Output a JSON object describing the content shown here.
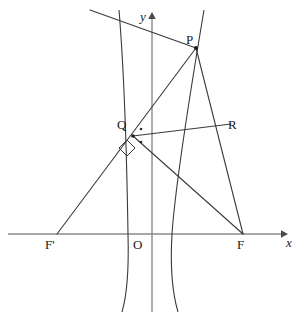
{
  "figure": {
    "width": 299,
    "height": 318,
    "background_color": "#ffffff",
    "curve_color": "#3a3a3a",
    "line_color": "#3a3a3a",
    "axis_color": "#8a8a8a",
    "label_color": "#1a1a1a"
  },
  "axes": {
    "x_axis": {
      "label": "x",
      "label_x": 288,
      "label_y": 241,
      "y": 234,
      "x_start": 8,
      "x_end": 284,
      "arrow": true
    },
    "y_axis": {
      "label": "y",
      "label_x": 140,
      "label_y": 13,
      "x": 152,
      "y_start": 312,
      "y_end": 16,
      "arrow": true
    },
    "origin": {
      "label": "O",
      "label_x": 134,
      "label_y": 240,
      "x": 152,
      "y": 234
    }
  },
  "points": [
    {
      "id": "P",
      "label": "P",
      "x": 196,
      "y": 48,
      "label_x": 186,
      "label_y": 38,
      "dot": true
    },
    {
      "id": "Q",
      "label": "Q",
      "x": 133,
      "y": 136,
      "label_x": 119,
      "label_y": 120,
      "dot": true
    },
    {
      "id": "R",
      "label": "R",
      "x": 222,
      "y": 128,
      "label_x": 228,
      "label_y": 119,
      "dot": false
    },
    {
      "id": "F1",
      "label": "F'",
      "x": 57,
      "y": 234,
      "label_x": 48,
      "label_y": 240,
      "dot": false
    },
    {
      "id": "F2",
      "label": "F",
      "x": 243,
      "y": 234,
      "label_x": 238,
      "label_y": 240,
      "dot": false
    }
  ],
  "segments": [
    {
      "id": "F1-P",
      "name": "segment-f-prime-to-p",
      "x1": 90,
      "y1": 10,
      "x2": 196,
      "y2": 48
    },
    {
      "id": "P-F2",
      "name": "segment-p-to-f",
      "x1": 196,
      "y1": 48,
      "x2": 243,
      "y2": 234
    },
    {
      "id": "Q-F2",
      "name": "segment-q-to-f",
      "x1": 133,
      "y1": 136,
      "x2": 243,
      "y2": 234
    },
    {
      "id": "Q-R",
      "name": "segment-q-to-r",
      "x1": 133,
      "y1": 136,
      "x2": 230,
      "y2": 124
    },
    {
      "id": "F1-Q",
      "name": "segment-f-prime-to-q",
      "x1": 57,
      "y1": 234,
      "x2": 133,
      "y2": 136
    }
  ],
  "curves": [
    {
      "id": "left-branch",
      "name": "hyperbola-left-branch",
      "path": "M 119 10 C 124 70, 127 170, 128 234 C 129 270, 127 295, 122 312"
    },
    {
      "id": "right-branch",
      "name": "hyperbola-right-branch",
      "path": "M 204 10 C 194 70, 176 175, 172 234 C 170 268, 173 295, 178 312"
    }
  ],
  "marks": {
    "right_angle": {
      "name": "right-angle-marker",
      "points": "127,140 135,148 127,156 119,148"
    },
    "angle_ticks": [
      {
        "name": "angle-tick-upper",
        "x": 141,
        "y": 129
      },
      {
        "name": "angle-tick-lower",
        "x": 141,
        "y": 142
      }
    ]
  }
}
